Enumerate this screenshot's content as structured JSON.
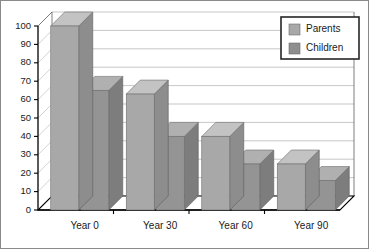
{
  "chart_data": {
    "type": "bar",
    "title": "",
    "subtitle": "",
    "xlabel": "",
    "ylabel": "",
    "categories": [
      "Year 0",
      "Year 30",
      "Year 60",
      "Year 90"
    ],
    "series": [
      {
        "name": "Parents",
        "values": [
          100,
          63,
          40,
          25
        ],
        "color": "#a8a8a8"
      },
      {
        "name": "Children",
        "values": [
          65,
          40,
          25,
          16
        ],
        "color": "#949494"
      }
    ],
    "ylim": [
      0,
      100
    ],
    "yticks": [
      0,
      10,
      20,
      30,
      40,
      50,
      60,
      70,
      80,
      90,
      100
    ],
    "ytick_labels": [
      "0",
      "10",
      "20",
      "30",
      "40",
      "50",
      "60",
      "70",
      "80",
      "90",
      "100"
    ],
    "grid": true,
    "grid_axis": "y",
    "legend_position": "top-right",
    "projection": "3d",
    "annotations": []
  },
  "legend": {
    "entries": [
      {
        "label": "Parents",
        "swatch_color": "#a8a8a8"
      },
      {
        "label": "Children",
        "swatch_color": "#8e8e8e"
      }
    ]
  },
  "colors": {
    "background": "#ffffff",
    "frame_border": "#8a8a8a",
    "gridline": "#b9b9b9",
    "axis": "#000000",
    "text": "#1a1a1a",
    "parents_front": "#a8a8a8",
    "parents_top": "#c3c3c3",
    "parents_side": "#8d8d8d",
    "children_front": "#949494",
    "children_top": "#b0b0b0",
    "children_side": "#7d7d7d"
  },
  "axis": {
    "y_ticks": [
      "100",
      "90",
      "80",
      "70",
      "60",
      "50",
      "40",
      "30",
      "20",
      "10",
      "0"
    ],
    "x_categories": [
      "Year 0",
      "Year 30",
      "Year 60",
      "Year 90"
    ]
  }
}
